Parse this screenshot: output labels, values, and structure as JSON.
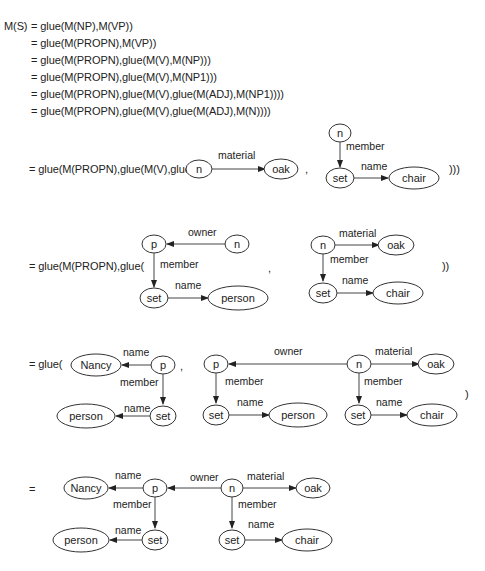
{
  "derivation": {
    "lhs": "M(S)",
    "lines": [
      "= glue(M(NP),M(VP))",
      "= glue(M(PROPN),M(VP))",
      "= glue(M(PROPN),glue(M(V),M(NP)))",
      "= glue(M(PROPN),glue(M(V),M(NP1)))",
      "= glue(M(PROPN),glue(M(V),glue(M(ADJ),M(NP1))))",
      "= glue(M(PROPN),glue(M(V),glue(M(ADJ),M(N))))"
    ]
  },
  "step1": {
    "prefix": "= glue(M(PROPN),glue(M(V),glue(",
    "comma": ",",
    "suffix": ")))",
    "graph_a": {
      "n": "n",
      "oak": "oak",
      "material": "material"
    },
    "graph_b": {
      "n": "n",
      "set": "set",
      "chair": "chair",
      "member": "member",
      "name": "name"
    }
  },
  "step2": {
    "prefix": "= glue(M(PROPN),glue(",
    "comma": ",",
    "suffix": "))",
    "graph_a": {
      "p": "p",
      "n": "n",
      "set": "set",
      "person": "person",
      "owner": "owner",
      "member": "member",
      "name": "name"
    },
    "graph_b": {
      "n": "n",
      "oak": "oak",
      "set": "set",
      "chair": "chair",
      "material": "material",
      "member": "member",
      "name": "name"
    }
  },
  "step3": {
    "prefix": "= glue(",
    "comma": ",",
    "suffix": ")",
    "graph_a": {
      "nancy": "Nancy",
      "p": "p",
      "set": "set",
      "person": "person",
      "name1": "name",
      "member": "member",
      "name2": "name"
    },
    "graph_b": {
      "p": "p",
      "n": "n",
      "oak": "oak",
      "set1": "set",
      "person": "person",
      "set2": "set",
      "chair": "chair",
      "owner": "owner",
      "material": "material",
      "member1": "member",
      "member2": "member",
      "name1": "name",
      "name2": "name"
    }
  },
  "final": {
    "prefix": "=",
    "graph": {
      "nancy": "Nancy",
      "p": "p",
      "n": "n",
      "oak": "oak",
      "set1": "set",
      "person": "person",
      "set2": "set",
      "chair": "chair",
      "name_top": "name",
      "owner": "owner",
      "material": "material",
      "member1": "member",
      "member2": "member",
      "name1": "name",
      "name2": "name"
    }
  }
}
